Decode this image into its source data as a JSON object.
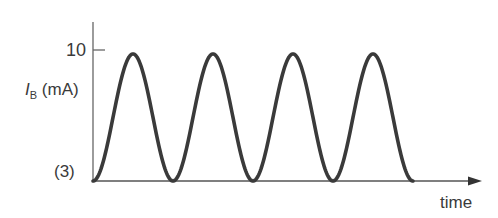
{
  "chart_data": {
    "type": "line",
    "title": "",
    "xlabel": "time",
    "ylabel": "I_B (mA)",
    "ylabel_parts": {
      "symbol": "I",
      "subscript": "B",
      "unit": "(mA)"
    },
    "y_ticks": [
      {
        "value": 10,
        "label": "10"
      }
    ],
    "y_baseline_label": "(3)",
    "ylim": [
      0,
      10
    ],
    "grid": false,
    "legend": null,
    "series": [
      {
        "name": "I_B",
        "color": "#3a3a3a",
        "x": [
          0,
          0.5,
          1,
          1.5,
          2,
          2.5,
          3,
          3.5,
          4
        ],
        "y": [
          0,
          9.7,
          0,
          9.7,
          0,
          9.7,
          0,
          9.7,
          0
        ]
      }
    ],
    "cycles": 4
  },
  "labels": {
    "y_tick_10": "10",
    "y_symbol": "I",
    "y_subscript": "B",
    "y_unit": "(mA)",
    "baseline_marker": "(3)",
    "x_axis": "time"
  },
  "colors": {
    "curve": "#3a3a3a",
    "axis": "#555555",
    "text": "#3a3a3a"
  }
}
